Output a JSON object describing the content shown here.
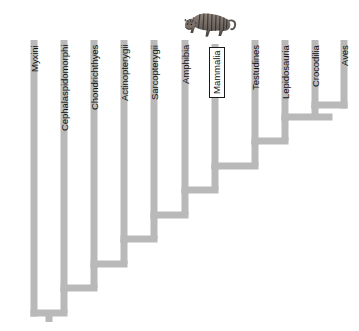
{
  "figure": {
    "name": "vertebrate-cladogram",
    "type": "phylogenetic-cladogram",
    "orientation": "tips-up-ladderized-right",
    "background_color": "#ffffff",
    "branch_color": "#b9b9b9",
    "branch_width_px": 7,
    "label_color": "#111111",
    "highlight": {
      "taxon": "Mammalia",
      "style": "white-box-with-black-border",
      "border_color": "#1a1a1a",
      "fill_color": "#ffffff"
    },
    "illustration": {
      "name": "tiger-illustration",
      "subject": "tiger",
      "position": "above-mammalia-label"
    }
  },
  "taxa": [
    {
      "label": "Myxini",
      "x": 34,
      "tip_y": 40,
      "node_y": 313,
      "boxed": false,
      "label_top": 45
    },
    {
      "label": "Cephalaspidomorphi",
      "x": 64,
      "tip_y": 40,
      "node_y": 288,
      "boxed": false,
      "label_top": 45
    },
    {
      "label": "Chondrichthyes",
      "x": 94,
      "tip_y": 40,
      "node_y": 264,
      "boxed": false,
      "label_top": 45
    },
    {
      "label": "Actinopterygii",
      "x": 124,
      "tip_y": 40,
      "node_y": 239,
      "boxed": false,
      "label_top": 45
    },
    {
      "label": "Sarcopterygii",
      "x": 154,
      "tip_y": 40,
      "node_y": 215,
      "boxed": false,
      "label_top": 45
    },
    {
      "label": "Amphibia",
      "x": 185,
      "tip_y": 40,
      "node_y": 190,
      "boxed": false,
      "label_top": 45
    },
    {
      "label": "Mammalia",
      "x": 215,
      "tip_y": 44,
      "node_y": 166,
      "boxed": true,
      "label_top": 47
    },
    {
      "label": "Testudines",
      "x": 255,
      "tip_y": 40,
      "node_y": 141,
      "boxed": false,
      "label_top": 45
    },
    {
      "label": "Lepidosauria",
      "x": 285,
      "tip_y": 40,
      "node_y": 117,
      "boxed": false,
      "label_top": 45
    },
    {
      "label": "Crocodilia",
      "x": 315,
      "tip_y": 40,
      "node_y": 105,
      "boxed": false,
      "label_top": 45
    },
    {
      "label": "Aves",
      "x": 344,
      "tip_y": 40,
      "node_y": 105,
      "boxed": false,
      "label_top": 45
    }
  ],
  "internal_nodes": [
    {
      "name": "craniata-root",
      "y": 313,
      "x_left": 34,
      "x_right": 64,
      "stub": true
    },
    {
      "name": "vertebrata",
      "y": 288,
      "x_left": 64,
      "x_right": 94
    },
    {
      "name": "gnathostomata",
      "y": 264,
      "x_left": 94,
      "x_right": 124
    },
    {
      "name": "osteichthyes",
      "y": 239,
      "x_left": 124,
      "x_right": 154
    },
    {
      "name": "tetrapoda-stem",
      "y": 215,
      "x_left": 154,
      "x_right": 185
    },
    {
      "name": "tetrapoda",
      "y": 190,
      "x_left": 185,
      "x_right": 215
    },
    {
      "name": "amniota",
      "y": 166,
      "x_left": 215,
      "x_right": 255
    },
    {
      "name": "reptilia",
      "y": 141,
      "x_left": 255,
      "x_right": 285
    },
    {
      "name": "archosauria-stem",
      "y": 117,
      "x_left": 285,
      "x_right": 329
    },
    {
      "name": "archosauria",
      "y": 105,
      "x_left": 315,
      "x_right": 344
    }
  ],
  "chart_data": {
    "type": "tree",
    "title": "",
    "xlabel": "",
    "ylabel": "",
    "leaf_order": [
      "Myxini",
      "Cephalaspidomorphi",
      "Chondrichthyes",
      "Actinopterygii",
      "Sarcopterygii",
      "Amphibia",
      "Mammalia",
      "Testudines",
      "Lepidosauria",
      "Crocodilia",
      "Aves"
    ],
    "newick": "(Myxini,(Cephalaspidomorphi,(Chondrichthyes,(Actinopterygii,(Sarcopterygii,(Amphibia,(Mammalia,(Testudines,(Lepidosauria,(Crocodilia,Aves))))))))));",
    "highlighted_leaf": "Mammalia",
    "legend": []
  }
}
